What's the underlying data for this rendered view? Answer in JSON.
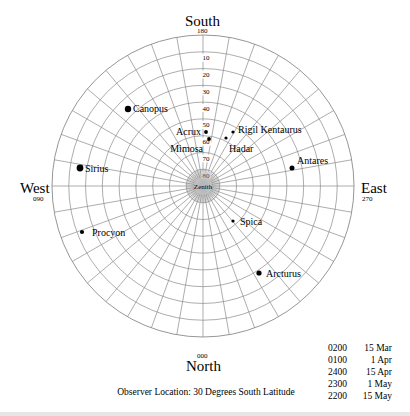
{
  "chart_data": {
    "type": "polar-sky-chart",
    "title": "",
    "center": [
      203,
      186
    ],
    "radius": 151,
    "azimuth_spoke_step_deg": 10,
    "altitude_ring_step_deg": 10,
    "altitude_labels": [
      {
        "alt": 10,
        "text": "10"
      },
      {
        "alt": 20,
        "text": "20"
      },
      {
        "alt": 30,
        "text": "30"
      },
      {
        "alt": 40,
        "text": "40"
      },
      {
        "alt": 50,
        "text": "50"
      },
      {
        "alt": 60,
        "text": "60"
      },
      {
        "alt": 70,
        "text": "70"
      },
      {
        "alt": 80,
        "text": "80"
      }
    ],
    "zenith_label": "Zenith",
    "stars": [
      {
        "name": "Canopus",
        "x": 128,
        "y": 109,
        "size": 3.2,
        "label_dx": 5,
        "label_dy": -1,
        "anchor": "start"
      },
      {
        "name": "Acrux",
        "x": 206,
        "y": 132,
        "size": 1.9,
        "label_dx": -5,
        "label_dy": -1,
        "anchor": "end"
      },
      {
        "name": "Mimosa",
        "x": 209,
        "y": 139,
        "size": 1.9,
        "label_dx": -6,
        "label_dy": 9,
        "anchor": "end"
      },
      {
        "name": "Rigil Kentaurus",
        "x": 233,
        "y": 132,
        "size": 1.6,
        "label_dx": 5,
        "label_dy": -3,
        "anchor": "start"
      },
      {
        "name": "Hadar",
        "x": 226,
        "y": 138,
        "size": 1.6,
        "label_dx": 3,
        "label_dy": 10,
        "anchor": "start"
      },
      {
        "name": "Sirius",
        "x": 80,
        "y": 168,
        "size": 3.4,
        "label_dx": 5,
        "label_dy": 0,
        "anchor": "start"
      },
      {
        "name": "Antares",
        "x": 292,
        "y": 168,
        "size": 2.5,
        "label_dx": 5,
        "label_dy": -8,
        "anchor": "start"
      },
      {
        "name": "Procyon",
        "x": 82,
        "y": 232,
        "size": 2.1,
        "label_dx": 10,
        "label_dy": 0,
        "anchor": "start"
      },
      {
        "name": "Spica",
        "x": 233,
        "y": 221,
        "size": 1.6,
        "label_dx": 7,
        "label_dy": 0,
        "anchor": "start"
      },
      {
        "name": "Arcturus",
        "x": 259,
        "y": 273,
        "size": 2.6,
        "label_dx": 7,
        "label_dy": 0,
        "anchor": "start"
      }
    ],
    "directions": [
      {
        "name": "South",
        "bearing": "180"
      },
      {
        "name": "West",
        "bearing": "090"
      },
      {
        "name": "East",
        "bearing": "270"
      },
      {
        "name": "North",
        "bearing": "000"
      }
    ]
  },
  "directions": {
    "south": {
      "label": "South",
      "bearing": "180"
    },
    "west": {
      "label": "West",
      "bearing": "090"
    },
    "east": {
      "label": "East",
      "bearing": "270"
    },
    "north": {
      "label": "North",
      "bearing": "000"
    }
  },
  "legend": [
    {
      "time": "0200",
      "date": "15 Mar"
    },
    {
      "time": "0100",
      "date": "1 Apr"
    },
    {
      "time": "2400",
      "date": "15 Apr"
    },
    {
      "time": "2300",
      "date": "1 May"
    },
    {
      "time": "2200",
      "date": "15 May"
    }
  ],
  "observer": "Observer Location: 30 Degrees South Latitude",
  "colors": {
    "grid": "#8a8a8a",
    "star": "#000000",
    "bottom_bar": "#e6e6e6"
  }
}
